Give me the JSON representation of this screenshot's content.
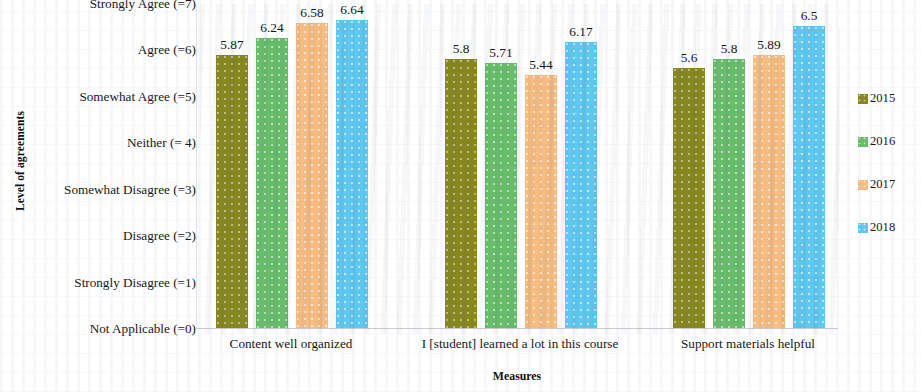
{
  "chart_data": {
    "type": "bar",
    "title": "",
    "xlabel": "Measures",
    "ylabel": "Level of agreements",
    "ylim": [
      0,
      7
    ],
    "grid": false,
    "legend_position": "right",
    "categories": [
      "Content well organized",
      "I [student] learned a lot in this course",
      "Support materials helpful"
    ],
    "ytick_labels": [
      "Strongly Agree (=7)",
      "Agree (=6)",
      "Somewhat Agree (=5)",
      "Neither (= 4)",
      "Somewhat Disagree (=3)",
      "Disagree (=2)",
      "Strongly Disagree (=1)",
      "Not Applicable (=0)"
    ],
    "ytick_values": [
      7,
      6,
      5,
      4,
      3,
      2,
      1,
      0
    ],
    "series": [
      {
        "name": "2015",
        "color": "#87871f",
        "values": [
          5.87,
          5.8,
          5.6
        ],
        "labels": [
          "5.87",
          "5.8",
          "5.6"
        ]
      },
      {
        "name": "2016",
        "color": "#68bd6b",
        "values": [
          6.24,
          5.71,
          5.8
        ],
        "labels": [
          "6.24",
          "5.71",
          "5.8"
        ]
      },
      {
        "name": "2017",
        "color": "#f6bc81",
        "values": [
          6.58,
          5.44,
          5.89
        ],
        "labels": [
          "6.58",
          "5.44",
          "5.89"
        ]
      },
      {
        "name": "2018",
        "color": "#5ec8f1",
        "values": [
          6.64,
          6.17,
          6.5
        ],
        "labels": [
          "6.64",
          "6.17",
          "6.5"
        ]
      }
    ]
  },
  "legend": {
    "items": [
      {
        "label": "2015",
        "color": "#87871f"
      },
      {
        "label": "2016",
        "color": "#68bd6b"
      },
      {
        "label": "2017",
        "color": "#f6bc81"
      },
      {
        "label": "2018",
        "color": "#5ec8f1"
      }
    ]
  },
  "axes": {
    "y_title": "Level of agreements",
    "x_title": "Measures"
  }
}
